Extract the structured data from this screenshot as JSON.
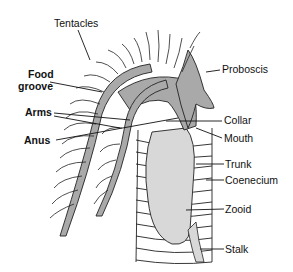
{
  "diagram": {
    "colors": {
      "body_fill": "#a9a9a9",
      "zooid_fill": "#d8d8d8",
      "outline": "#222222",
      "background": "#ffffff"
    },
    "labels": {
      "tentacles": "Tentacles",
      "food_groove_1": "Food",
      "food_groove_2": "groove",
      "arms": "Arms",
      "anus": "Anus",
      "proboscis": "Proboscis",
      "collar": "Collar",
      "mouth": "Mouth",
      "trunk": "Trunk",
      "coenecium": "Coenecium",
      "zooid": "Zooid",
      "stalk": "Stalk"
    }
  }
}
